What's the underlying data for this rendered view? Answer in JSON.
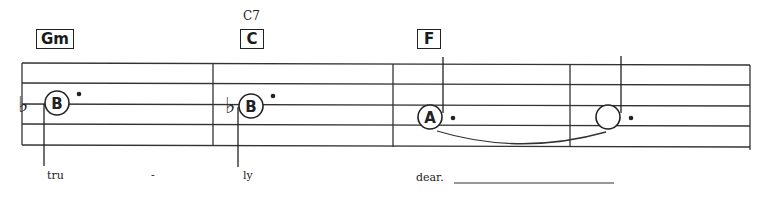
{
  "score": {
    "measures": [
      {
        "chord": "Gm",
        "chord_alt": "",
        "note": "B",
        "accidental": "♭",
        "duration": "dotted-half",
        "lyric": "tru",
        "lyric_hyphen": "-"
      },
      {
        "chord": "C",
        "chord_alt": "C7",
        "note": "B",
        "accidental": "♭",
        "duration": "dotted-half",
        "lyric": "ly",
        "lyric_hyphen": ""
      },
      {
        "chord": "F",
        "chord_alt": "",
        "note": "A",
        "accidental": "",
        "duration": "dotted-half",
        "lyric": "dear.",
        "lyric_hyphen": "",
        "tie_to_next": true
      },
      {
        "chord": "",
        "chord_alt": "",
        "note": "",
        "accidental": "",
        "duration": "dotted-half-tied",
        "lyric": "",
        "lyric_hyphen": ""
      }
    ],
    "staff": {
      "lines": 5,
      "line_color": "#333333"
    }
  }
}
